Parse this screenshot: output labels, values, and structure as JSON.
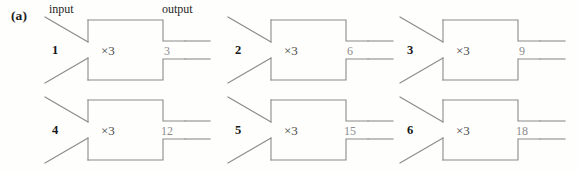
{
  "figure": {
    "panel_label": "(a)",
    "headers": {
      "input": "input",
      "output": "output"
    },
    "operation_label": "×3",
    "stroke_color": "#8a8a8a",
    "background_color": "#fefefd",
    "input_text_color": "#161616",
    "output_text_color": "#8c8c8c"
  },
  "machines": [
    {
      "id": "machine-1",
      "input": "1",
      "operation": "×3",
      "output": "3"
    },
    {
      "id": "machine-2",
      "input": "2",
      "operation": "×3",
      "output": "6"
    },
    {
      "id": "machine-3",
      "input": "3",
      "operation": "×3",
      "output": "9"
    },
    {
      "id": "machine-4",
      "input": "4",
      "operation": "×3",
      "output": "12"
    },
    {
      "id": "machine-5",
      "input": "5",
      "operation": "×3",
      "output": "15"
    },
    {
      "id": "machine-6",
      "input": "6",
      "operation": "×3",
      "output": "18"
    }
  ]
}
